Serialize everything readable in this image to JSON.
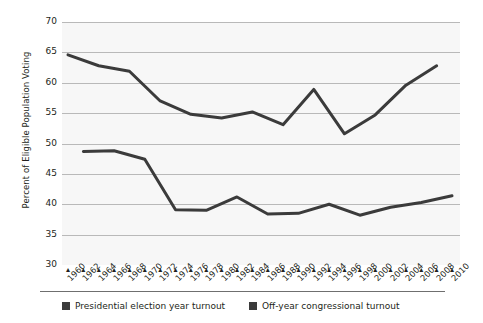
{
  "chart_data": {
    "type": "line",
    "title": "",
    "xlabel": "",
    "ylabel": "Percent of Eligible Population Voting",
    "ylim": [
      30,
      70
    ],
    "ytick_values": [
      30,
      35,
      40,
      45,
      50,
      55,
      60,
      65,
      70
    ],
    "ytick_labels": [
      "30",
      "35",
      "40",
      "45",
      "50",
      "55",
      "60",
      "65",
      "70"
    ],
    "grid": true,
    "legend_position": "bottom",
    "x": [
      1960,
      1962,
      1964,
      1966,
      1968,
      1970,
      1972,
      1974,
      1976,
      1978,
      1980,
      1982,
      1984,
      1986,
      1988,
      1990,
      1992,
      1994,
      1996,
      1998,
      2000,
      2002,
      2004,
      2006,
      2008,
      2010
    ],
    "xtick_labels": [
      "1960",
      "1962",
      "1964",
      "1966",
      "1968",
      "1970",
      "1972",
      "1974",
      "1976",
      "1978",
      "1980",
      "1982",
      "1984",
      "1986",
      "1988",
      "1990",
      "1992",
      "1994",
      "1996",
      "1998",
      "2000",
      "2002",
      "2004",
      "2006",
      "2008",
      "2010"
    ],
    "series": [
      {
        "name": "Presidential election year turnout",
        "color": "#3b3b3b",
        "x": [
          1960,
          1964,
          1968,
          1972,
          1976,
          1980,
          1984,
          1988,
          1992,
          1996,
          2000,
          2004,
          2008
        ],
        "values": [
          64.6,
          62.8,
          61.9,
          57.0,
          54.8,
          54.2,
          55.2,
          53.1,
          58.9,
          51.6,
          54.7,
          59.6,
          62.8
        ]
      },
      {
        "name": "Off-year congressional turnout",
        "color": "#3b3b3b",
        "x": [
          1962,
          1966,
          1970,
          1974,
          1978,
          1982,
          1986,
          1990,
          1994,
          1998,
          2002,
          2006,
          2010
        ],
        "values": [
          48.7,
          48.8,
          47.4,
          39.1,
          39.0,
          41.2,
          38.4,
          38.5,
          40.0,
          38.2,
          39.5,
          40.3,
          41.4
        ]
      }
    ]
  },
  "legend": {
    "presidential": "Presidential election year turnout",
    "congressional": "Off-year congressional turnout"
  }
}
